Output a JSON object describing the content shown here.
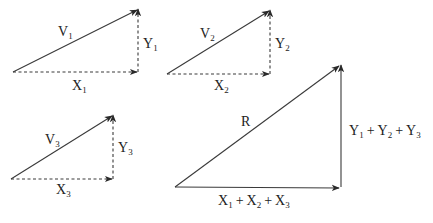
{
  "diagram": {
    "title": "",
    "colors": {
      "stroke": "#3a3a3a",
      "text": "#222222",
      "background": "#ffffff"
    },
    "triangles": [
      {
        "id": "v1",
        "vector": {
          "letter": "V",
          "sub": "1"
        },
        "x_component": {
          "letter": "X",
          "sub": "1"
        },
        "y_component": {
          "letter": "Y",
          "sub": "1"
        },
        "style": "dashed-components"
      },
      {
        "id": "v2",
        "vector": {
          "letter": "V",
          "sub": "2"
        },
        "x_component": {
          "letter": "X",
          "sub": "2"
        },
        "y_component": {
          "letter": "Y",
          "sub": "2"
        },
        "style": "dashed-components"
      },
      {
        "id": "v3",
        "vector": {
          "letter": "V",
          "sub": "3"
        },
        "x_component": {
          "letter": "X",
          "sub": "3"
        },
        "y_component": {
          "letter": "Y",
          "sub": "3"
        },
        "style": "dashed-components"
      },
      {
        "id": "resultant",
        "vector": {
          "letter": "R"
        },
        "x_component": {
          "terms": [
            {
              "letter": "X",
              "sub": "1"
            },
            {
              "letter": "X",
              "sub": "2"
            },
            {
              "letter": "X",
              "sub": "3"
            }
          ],
          "operator": "+"
        },
        "y_component": {
          "terms": [
            {
              "letter": "Y",
              "sub": "1"
            },
            {
              "letter": "Y",
              "sub": "2"
            },
            {
              "letter": "Y",
              "sub": "3"
            }
          ],
          "operator": "+"
        },
        "style": "solid-components"
      }
    ]
  }
}
